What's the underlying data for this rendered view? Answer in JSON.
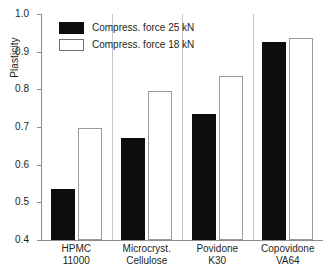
{
  "chart_data": {
    "type": "bar",
    "title": "",
    "xlabel": "",
    "ylabel": "Plasticity",
    "ylim": [
      0.4,
      1.0
    ],
    "ytick_labels": [
      "1.0",
      "0.9",
      "0.8",
      "0.7",
      "0.6",
      "0.5",
      "0.4"
    ],
    "ytick_values": [
      1.0,
      0.9,
      0.8,
      0.7,
      0.6,
      0.5,
      0.4
    ],
    "grid": false,
    "legend_position": "top-left-inside",
    "categories": [
      {
        "line1": "HPMC",
        "line2": "11000"
      },
      {
        "line1": "Microcryst.",
        "line2": "Cellulose"
      },
      {
        "line1": "Povidone",
        "line2": "K30"
      },
      {
        "line1": "Copovidone",
        "line2": "VA64"
      }
    ],
    "series": [
      {
        "name": "Compress. force 25 kN",
        "color": "#0d0d0d",
        "values": [
          0.535,
          0.672,
          0.735,
          0.925
        ]
      },
      {
        "name": "Compress. force 18 kN",
        "color": "#ffffff",
        "values": [
          0.697,
          0.795,
          0.835,
          0.935
        ]
      }
    ]
  },
  "legend": {
    "items": [
      {
        "label": "Compress. force 25 kN",
        "swatch": "dark"
      },
      {
        "label": "Compress. force 18 kN",
        "swatch": "light"
      }
    ]
  }
}
